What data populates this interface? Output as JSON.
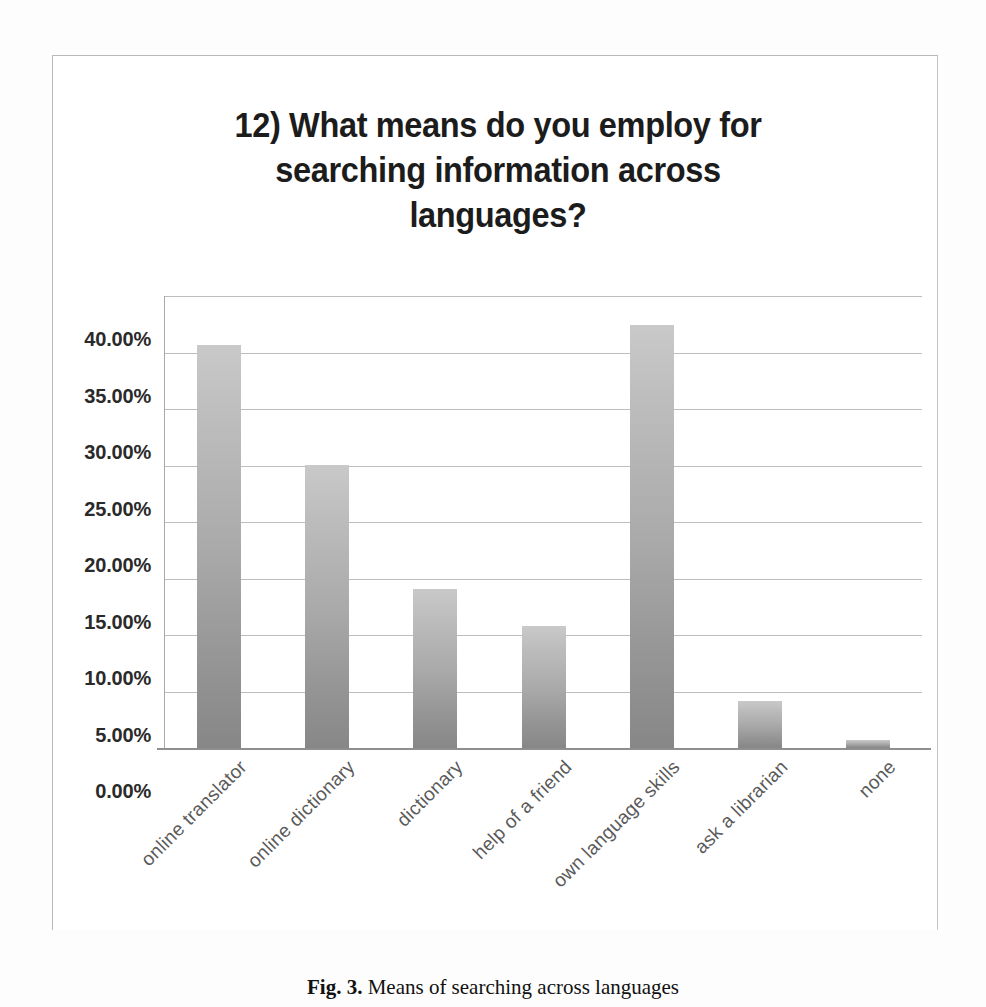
{
  "chart_data": {
    "type": "bar",
    "title": "12) What means do you employ for searching information across languages?",
    "title_lines": [
      "12) What means do you employ for",
      "searching information across",
      "languages?"
    ],
    "categories": [
      "online translator",
      "online dictionary",
      "dictionary",
      "help of a friend",
      "own language skills",
      "ask a librarian",
      "none"
    ],
    "values": [
      35.7,
      25.0,
      14.1,
      10.8,
      37.4,
      4.2,
      0.7
    ],
    "value_labels": [
      "35.70%",
      "25.00%",
      "14.10%",
      "10.80%",
      "37.40%",
      "4.20%",
      "0.70%"
    ],
    "xlabel": "",
    "ylabel": "",
    "ylim": [
      0,
      40
    ],
    "ytick_values": [
      40,
      35,
      30,
      25,
      20,
      15,
      10,
      5,
      0
    ],
    "ytick_labels": [
      "40.00%",
      "35.00%",
      "30.00%",
      "25.00%",
      "20.00%",
      "15.00%",
      "10.00%",
      "5.00%",
      "0.00%"
    ],
    "grid": true,
    "legend": false,
    "bar_color_top": "#c9c9c9",
    "bar_color_bottom": "#878787",
    "gridline_color": "#bdbdbd",
    "axis_color": "#8f8f8f"
  },
  "caption": {
    "label": "Fig. 3.",
    "text": " Means of searching across languages"
  }
}
